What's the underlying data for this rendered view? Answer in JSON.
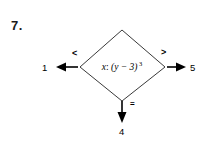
{
  "problem": {
    "number": "7."
  },
  "diagram": {
    "type": "decision-flowchart",
    "decision_node": {
      "shape": "diamond",
      "expression_prefix": "x",
      "separator": ":",
      "expression_body": "(y − 3)",
      "exponent": "3",
      "full_text": "x: (y − 3) 3"
    },
    "branches": [
      {
        "id": "left",
        "label": "<",
        "direction": "left",
        "terminal": "1"
      },
      {
        "id": "right",
        "label": ">",
        "direction": "right",
        "terminal": "5"
      },
      {
        "id": "down",
        "label": "=",
        "direction": "down",
        "terminal": "4"
      }
    ],
    "colors": {
      "background": "#ffffff",
      "stroke": "#000000",
      "text": "#000000"
    }
  }
}
